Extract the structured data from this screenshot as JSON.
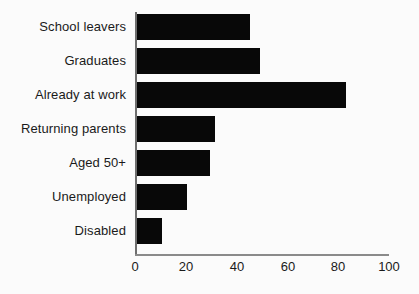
{
  "chart_data": {
    "type": "bar",
    "orientation": "horizontal",
    "title": "",
    "subtitle": "",
    "xlabel": "",
    "ylabel": "",
    "categories": [
      "School leavers",
      "Graduates",
      "Already at work",
      "Returning parents",
      "Aged 50+",
      "Unemployed",
      "Disabled"
    ],
    "values": [
      45,
      49,
      83,
      31,
      29,
      20,
      10
    ],
    "xlim": [
      0,
      100
    ],
    "xticks": [
      0,
      20,
      40,
      60,
      80,
      100
    ],
    "xtick_labels": [
      "0",
      "20",
      "40",
      "60",
      "80",
      "100"
    ],
    "grid": false,
    "legend": null,
    "bar_color": "#080808",
    "background_color": "#fbfbfb",
    "axis_color": "#6e6e6e"
  }
}
